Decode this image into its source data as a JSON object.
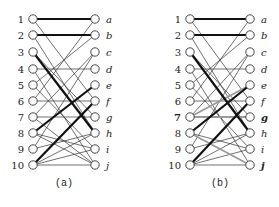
{
  "left_labels": [
    "1",
    "2",
    "3",
    "4",
    "5",
    "6",
    "7",
    "8",
    "9",
    "10"
  ],
  "right_labels": [
    "a",
    "b",
    "c",
    "d",
    "e",
    "f",
    "g",
    "h",
    "i",
    "j"
  ],
  "panels": [
    {
      "caption": "(a)",
      "left_x": 33,
      "right_x": 95,
      "bold_left_labels": [],
      "bold_right_labels": [],
      "edges": [
        {
          "l": 1,
          "r": "a",
          "style": "bold"
        },
        {
          "l": 1,
          "r": "f",
          "style": "thin"
        },
        {
          "l": 2,
          "r": "b",
          "style": "bold"
        },
        {
          "l": 2,
          "r": "h",
          "style": "thin"
        },
        {
          "l": 3,
          "r": "h",
          "style": "bold"
        },
        {
          "l": 3,
          "r": "g",
          "style": "thin"
        },
        {
          "l": 4,
          "r": "d",
          "style": "thin"
        },
        {
          "l": 4,
          "r": "j",
          "style": "thin"
        },
        {
          "l": 5,
          "r": "b",
          "style": "thin"
        },
        {
          "l": 5,
          "r": "i",
          "style": "thin"
        },
        {
          "l": 6,
          "r": "f",
          "style": "thin"
        },
        {
          "l": 6,
          "r": "a",
          "style": "thin"
        },
        {
          "l": 7,
          "r": "g",
          "style": "thin"
        },
        {
          "l": 7,
          "r": "c",
          "style": "thin"
        },
        {
          "l": 7,
          "r": "j",
          "style": "thin"
        },
        {
          "l": 8,
          "r": "e",
          "style": "bold"
        },
        {
          "l": 8,
          "r": "i",
          "style": "thin"
        },
        {
          "l": 8,
          "r": "j",
          "style": "thin"
        },
        {
          "l": 9,
          "r": "c",
          "style": "thin"
        },
        {
          "l": 9,
          "r": "h",
          "style": "thin"
        },
        {
          "l": 10,
          "r": "f",
          "style": "bold"
        },
        {
          "l": 10,
          "r": "i",
          "style": "thin"
        },
        {
          "l": 10,
          "r": "j",
          "style": "thin"
        },
        {
          "l": 10,
          "r": "h",
          "style": "thin"
        }
      ]
    },
    {
      "caption": "(b)",
      "left_x": 190,
      "right_x": 250,
      "bold_left_labels": [
        "7"
      ],
      "bold_right_labels": [
        "g",
        "j"
      ],
      "edges": [
        {
          "l": 1,
          "r": "a",
          "style": "bold"
        },
        {
          "l": 1,
          "r": "f",
          "style": "thin"
        },
        {
          "l": 2,
          "r": "b",
          "style": "bold"
        },
        {
          "l": 2,
          "r": "h",
          "style": "thin"
        },
        {
          "l": 3,
          "r": "h",
          "style": "bold"
        },
        {
          "l": 3,
          "r": "g",
          "style": "thin"
        },
        {
          "l": 4,
          "r": "d",
          "style": "thin"
        },
        {
          "l": 4,
          "r": "j",
          "style": "thin"
        },
        {
          "l": 5,
          "r": "b",
          "style": "thin"
        },
        {
          "l": 5,
          "r": "i",
          "style": "thin"
        },
        {
          "l": 6,
          "r": "f",
          "style": "thin"
        },
        {
          "l": 6,
          "r": "a",
          "style": "thin"
        },
        {
          "l": 7,
          "r": "g",
          "style": "gray"
        },
        {
          "l": 7,
          "r": "e",
          "style": "gray"
        },
        {
          "l": 7,
          "r": "c",
          "style": "thin"
        },
        {
          "l": 8,
          "r": "e",
          "style": "bold"
        },
        {
          "l": 8,
          "r": "j",
          "style": "gray"
        },
        {
          "l": 8,
          "r": "i",
          "style": "thin"
        },
        {
          "l": 9,
          "r": "c",
          "style": "thin"
        },
        {
          "l": 9,
          "r": "h",
          "style": "thin"
        },
        {
          "l": 10,
          "r": "f",
          "style": "bold"
        },
        {
          "l": 10,
          "r": "i",
          "style": "thin"
        },
        {
          "l": 10,
          "r": "j",
          "style": "thin"
        },
        {
          "l": 10,
          "r": "h",
          "style": "thin"
        }
      ]
    }
  ],
  "layout": {
    "row_y": [
      19,
      35,
      52,
      69,
      85,
      101,
      117,
      133,
      149,
      165
    ],
    "caption_y": 186,
    "colors": {
      "thin": "#333333",
      "bold": "#111111",
      "gray": "#999999"
    }
  }
}
